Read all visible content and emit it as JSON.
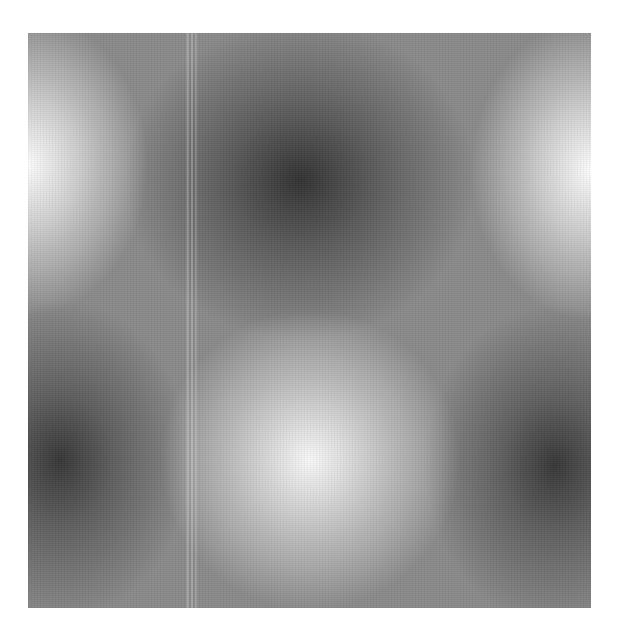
{
  "image": {
    "description": "Grayscale 2D sinusoidal interference pattern with alternating bright and dark blobs and a vertical stripe artifact",
    "plate": {
      "background": "#8a8a8a",
      "bright_color": "#f8f8f8",
      "dark_color": "#3a3a3a"
    },
    "features": [
      {
        "type": "bright",
        "position": "left-edge-upper"
      },
      {
        "type": "bright",
        "position": "right-edge-upper"
      },
      {
        "type": "bright",
        "position": "bottom-center"
      },
      {
        "type": "dark",
        "position": "top-center"
      },
      {
        "type": "dark",
        "position": "bottom-left"
      },
      {
        "type": "dark",
        "position": "bottom-right"
      }
    ],
    "artifact": "vertical light stripe left of center"
  }
}
